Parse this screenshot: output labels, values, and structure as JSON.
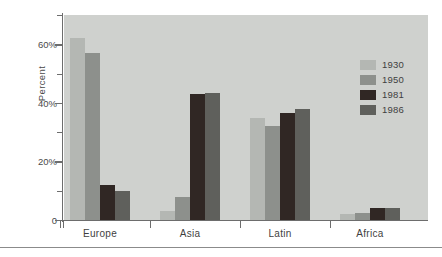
{
  "chart_data": {
    "type": "bar",
    "title": "",
    "xlabel": "",
    "ylabel": "Percent",
    "ylim": [
      0,
      70
    ],
    "grid": false,
    "legend_position": "top-right",
    "categories": [
      "Europe",
      "Asia",
      "Latin",
      "Africa"
    ],
    "ytick_labels": [
      "0",
      "20%",
      "40%",
      "60%"
    ],
    "ytick_values": [
      0,
      20,
      40,
      60
    ],
    "yminor_ticks": [
      10,
      30,
      50,
      70
    ],
    "series": [
      {
        "name": "1930",
        "color": "#b4b7b3",
        "values": [
          62,
          3,
          35,
          2
        ]
      },
      {
        "name": "1950",
        "color": "#8d908c",
        "values": [
          57,
          8,
          32,
          2.5
        ]
      },
      {
        "name": "1981",
        "color": "#302724",
        "values": [
          12,
          43,
          36.5,
          4
        ]
      },
      {
        "name": "1986",
        "color": "#5f605c",
        "values": [
          10,
          43.5,
          38,
          4
        ]
      }
    ]
  },
  "colors": {
    "plot_background": "#cfd1ce",
    "axis": "#6d6d6d",
    "text": "#3f3f3f",
    "footer_rule": "#8b8b8b"
  }
}
